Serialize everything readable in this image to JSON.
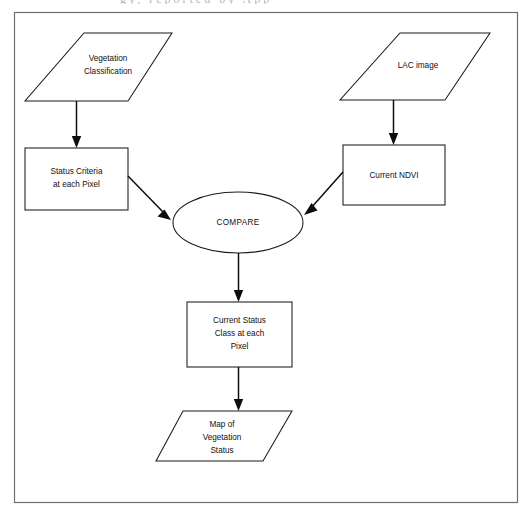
{
  "figure": {
    "type": "flowchart",
    "title_fragment_above_frame": "gy, reported by App",
    "border_color": "#6f6f6f",
    "shape_stroke_color": "#1b1b1b",
    "connector_color": "#0d0d0d",
    "background_color": "#ffffff"
  },
  "nodes": [
    {
      "id": "vegetation-classification",
      "shape": "parallelogram",
      "role": "input-data",
      "lines": [
        "Vegetation",
        "Classification"
      ],
      "text": "Vegetation Classification"
    },
    {
      "id": "lac-image",
      "shape": "parallelogram",
      "role": "input-data",
      "lines": [
        "LAC image"
      ],
      "text": "LAC image"
    },
    {
      "id": "status-criteria",
      "shape": "rectangle",
      "role": "process",
      "lines": [
        "Status Criteria",
        "at each Pixel"
      ],
      "text": "Status Criteria at each Pixel"
    },
    {
      "id": "current-ndvi",
      "shape": "rectangle",
      "role": "process",
      "lines": [
        "Current NDVI"
      ],
      "text": "Current NDVI"
    },
    {
      "id": "compare",
      "shape": "ellipse",
      "role": "operation",
      "lines": [
        "COMPARE"
      ],
      "text": "COMPARE"
    },
    {
      "id": "current-status-class",
      "shape": "rectangle",
      "role": "process",
      "lines": [
        "Current Status",
        "Class at each",
        "Pixel"
      ],
      "text": "Current Status Class at each Pixel"
    },
    {
      "id": "map-of-vegetation-status",
      "shape": "parallelogram",
      "role": "output-data",
      "lines": [
        "Map of",
        "Vegetation",
        "Status"
      ],
      "text": "Map of Vegetation Status"
    }
  ],
  "edges": [
    {
      "id": "edge-veg-to-criteria",
      "from": "vegetation-classification",
      "to": "status-criteria",
      "style": "arrow-down"
    },
    {
      "id": "edge-lac-to-ndvi",
      "from": "lac-image",
      "to": "current-ndvi",
      "style": "arrow-down"
    },
    {
      "id": "edge-criteria-to-compare",
      "from": "status-criteria",
      "to": "compare",
      "style": "arrow-diagonal"
    },
    {
      "id": "edge-ndvi-to-compare",
      "from": "current-ndvi",
      "to": "compare",
      "style": "arrow-diagonal"
    },
    {
      "id": "edge-compare-to-status",
      "from": "compare",
      "to": "current-status-class",
      "style": "arrow-down"
    },
    {
      "id": "edge-status-to-map",
      "from": "current-status-class",
      "to": "map-of-vegetation-status",
      "style": "arrow-down"
    }
  ]
}
